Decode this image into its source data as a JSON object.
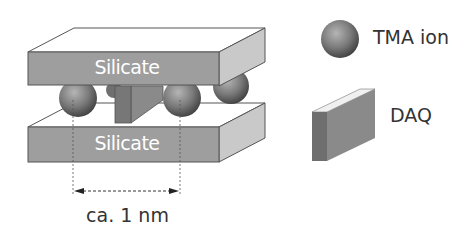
{
  "diagram": {
    "layers": [
      {
        "label": "Silicate",
        "position": "top"
      },
      {
        "label": "Silicate",
        "position": "bottom"
      }
    ],
    "spacing_label": "ca. 1 nm",
    "legend": [
      {
        "icon": "sphere-icon",
        "label": "TMA ion"
      },
      {
        "icon": "block-icon",
        "label": "DAQ"
      }
    ]
  }
}
